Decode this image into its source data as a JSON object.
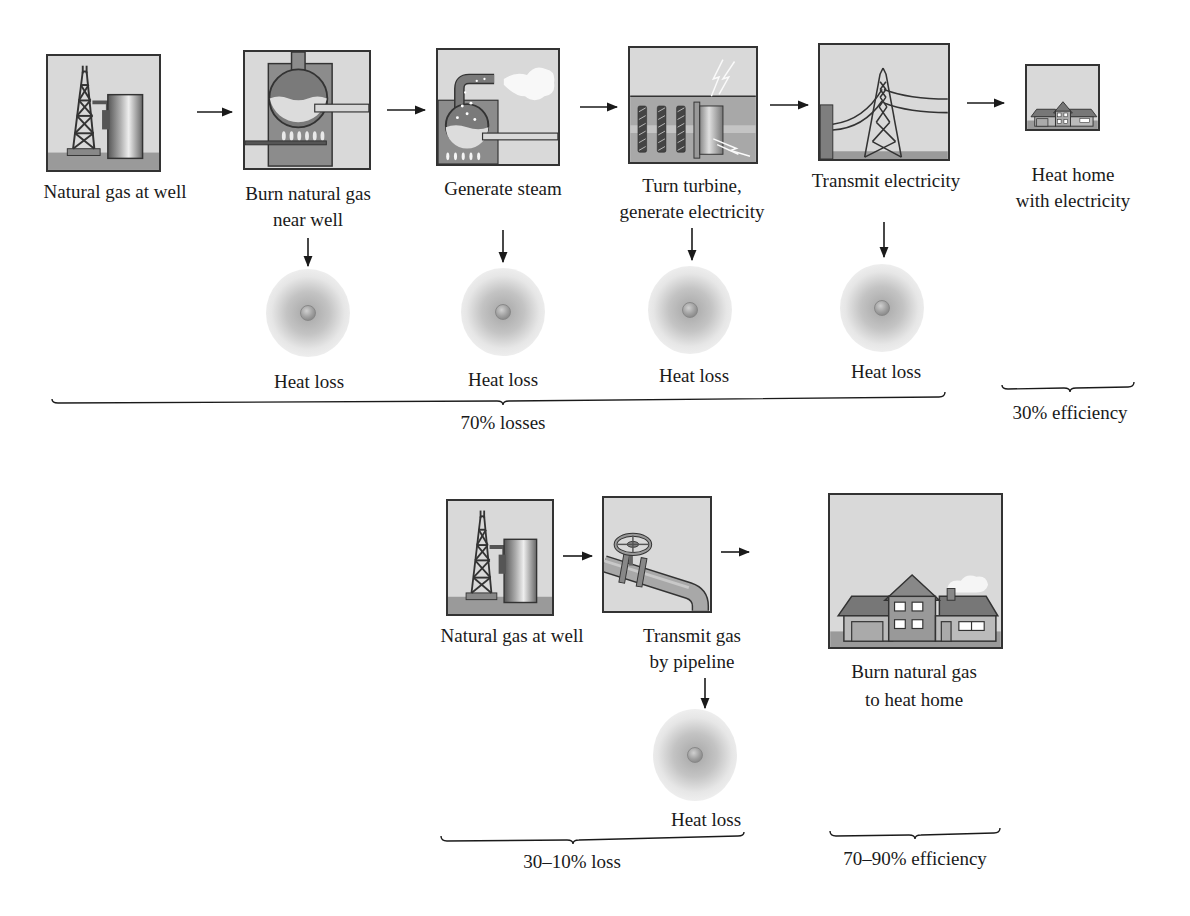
{
  "colors": {
    "panel_bg": "#d9d9d9",
    "panel_dark": "#8c8c8c",
    "ground": "#9a9a9a",
    "stroke": "#333333",
    "text": "#1a1a1a"
  },
  "top_chain": {
    "steps": [
      {
        "id": "well",
        "label_lines": [
          "Natural gas at well"
        ],
        "icon": "oil-derrick-and-tank-icon"
      },
      {
        "id": "burn",
        "label_lines": [
          "Burn natural gas",
          "near well"
        ],
        "icon": "boiler-burner-icon"
      },
      {
        "id": "steam",
        "label_lines": [
          "Generate steam"
        ],
        "icon": "steam-generator-icon"
      },
      {
        "id": "turbine",
        "label_lines": [
          "Turn turbine,",
          "generate electricity"
        ],
        "icon": "turbine-generator-icon"
      },
      {
        "id": "transmit",
        "label_lines": [
          "Transmit electricity"
        ],
        "icon": "power-transmission-tower-icon"
      },
      {
        "id": "home",
        "label_lines": [
          "Heat home",
          "with electricity"
        ],
        "icon": "house-icon"
      }
    ],
    "heat_losses": [
      {
        "label": "Heat loss",
        "from_step": "burn"
      },
      {
        "label": "Heat loss",
        "from_step": "steam"
      },
      {
        "label": "Heat loss",
        "from_step": "turbine"
      },
      {
        "label": "Heat loss",
        "from_step": "transmit"
      }
    ],
    "loss_bracket_label": "70% losses",
    "efficiency_bracket_label": "30% efficiency"
  },
  "bottom_chain": {
    "steps": [
      {
        "id": "well",
        "label_lines": [
          "Natural gas at well"
        ],
        "icon": "oil-derrick-and-tank-icon"
      },
      {
        "id": "pipeline",
        "label_lines": [
          "Transmit gas",
          "by pipeline"
        ],
        "icon": "pipeline-valve-icon"
      },
      {
        "id": "home",
        "label_lines": [
          "Burn natural gas",
          "to heat home"
        ],
        "icon": "house-icon"
      }
    ],
    "heat_losses": [
      {
        "label": "Heat loss",
        "from_step": "pipeline"
      }
    ],
    "loss_bracket_label": "30–10% loss",
    "efficiency_bracket_label": "70–90% efficiency"
  }
}
